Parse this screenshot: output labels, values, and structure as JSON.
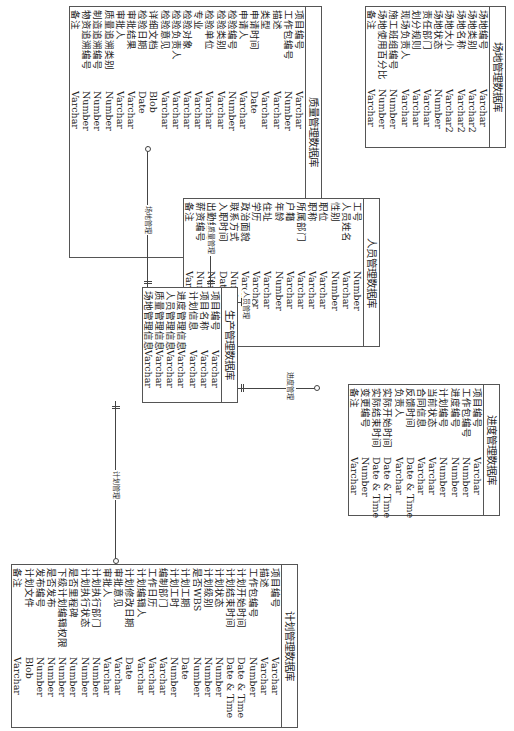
{
  "tables": {
    "site": {
      "title": "场地管理数据库",
      "fields": [
        {
          "name": "场地编号",
          "type": "Varchar"
        },
        {
          "name": "场地类别",
          "type": "Varchar2"
        },
        {
          "name": "场地名称",
          "type": "Varchar2"
        },
        {
          "name": "场地大小",
          "type": "Varchar2"
        },
        {
          "name": "场地状态",
          "type": "Number"
        },
        {
          "name": "责任部门",
          "type": "Varchar"
        },
        {
          "name": "划分规则",
          "type": "Varchar"
        },
        {
          "name": "现场负责人",
          "type": "Varchar"
        },
        {
          "name": "施工班组编号",
          "type": "Number"
        },
        {
          "name": "场地使用百分比",
          "type": "Number"
        },
        {
          "name": "备注",
          "type": "Varchar"
        }
      ]
    },
    "quality": {
      "title": "质量管理数据库",
      "fields": [
        {
          "name": "项目编号",
          "type": "Varchar"
        },
        {
          "name": "工作包编号",
          "type": "Number"
        },
        {
          "name": "描述",
          "type": "Varchar"
        },
        {
          "name": "类型",
          "type": "Varchar"
        },
        {
          "name": "申请时间",
          "type": "Date"
        },
        {
          "name": "申请人",
          "type": "Varchar"
        },
        {
          "name": "检验编号",
          "type": "Number"
        },
        {
          "name": "检验类别",
          "type": "Varchar"
        },
        {
          "name": "检验单位",
          "type": "Varchar"
        },
        {
          "name": "专业",
          "type": "Varchar"
        },
        {
          "name": "检验对象",
          "type": "Varchar"
        },
        {
          "name": "检验负责人",
          "type": "Varchar"
        },
        {
          "name": "检验意见",
          "type": "Varchar"
        },
        {
          "name": "详细文档",
          "type": "Blob"
        },
        {
          "name": "检验日期",
          "type": "Date"
        },
        {
          "name": "审批结果",
          "type": "Varchar"
        },
        {
          "name": "审批人",
          "type": "Varchar"
        },
        {
          "name": "质量追溯类别",
          "type": "Number"
        },
        {
          "name": "制造追溯编号",
          "type": "Number"
        },
        {
          "name": "物资追溯编号",
          "type": "Number"
        },
        {
          "name": "备注",
          "type": "Varchar"
        }
      ]
    },
    "personnel": {
      "title": "人员管理数据库",
      "fields": [
        {
          "name": "工号",
          "type": "Number"
        },
        {
          "name": "人员姓名",
          "type": "Varchar"
        },
        {
          "name": "性别",
          "type": "Number"
        },
        {
          "name": "职位",
          "type": "Varchar"
        },
        {
          "name": "职称",
          "type": "Varchar"
        },
        {
          "name": "所属部门",
          "type": "Varchar"
        },
        {
          "name": "户籍",
          "type": "Varchar"
        },
        {
          "name": "年龄",
          "type": "Number"
        },
        {
          "name": "住址",
          "type": "Varchar"
        },
        {
          "name": "学历",
          "type": "Varchar"
        },
        {
          "name": "政治面貌",
          "type": "Varchar"
        },
        {
          "name": "联系方式",
          "type": "Number"
        },
        {
          "name": "入职时间",
          "type": "Date"
        },
        {
          "name": "出勤编号",
          "type": "Number"
        },
        {
          "name": "薪资编号",
          "type": "Number"
        },
        {
          "name": "备注",
          "type": "Varchar"
        }
      ]
    },
    "production": {
      "title": "生产管理数据库",
      "fields": [
        {
          "name": "项目编号",
          "type": "Varchar"
        },
        {
          "name": "项目名称",
          "type": "Varchar"
        },
        {
          "name": "计划信息",
          "type": "Varchar"
        },
        {
          "name": "进度管理信息",
          "type": "Varchar"
        },
        {
          "name": "人员管理信息",
          "type": "Varchar"
        },
        {
          "name": "质量管理信息",
          "type": "Varchar"
        },
        {
          "name": "场地管理信息",
          "type": "Varchar"
        }
      ]
    },
    "progress": {
      "title": "进度管理数据库",
      "fields": [
        {
          "name": "项目编号",
          "type": "Varchar"
        },
        {
          "name": "工作包编号",
          "type": "Number"
        },
        {
          "name": "进度编号",
          "type": "Number"
        },
        {
          "name": "计划编号",
          "type": "Number"
        },
        {
          "name": "当前状态",
          "type": "Varchar"
        },
        {
          "name": "合同信息",
          "type": "Varchar"
        },
        {
          "name": "反馈时间",
          "type": "Date & Time"
        },
        {
          "name": "负责人",
          "type": "Varchar"
        },
        {
          "name": "实际开始时间",
          "type": "Date & Time"
        },
        {
          "name": "实际结束时间",
          "type": "Date & Time"
        },
        {
          "name": "变更编号",
          "type": "Number"
        },
        {
          "name": "备注",
          "type": "Varchar"
        }
      ]
    },
    "plan": {
      "title": "计划管理数据库",
      "fields": [
        {
          "name": "项目编号",
          "type": "Varchar"
        },
        {
          "name": "描述",
          "type": "Varchar"
        },
        {
          "name": "工作包编号",
          "type": "Number"
        },
        {
          "name": "计划开始时间",
          "type": "Date & Time"
        },
        {
          "name": "计划结束时间",
          "type": "Date & Time"
        },
        {
          "name": "计划状态",
          "type": "Number"
        },
        {
          "name": "计划级别",
          "type": "Number"
        },
        {
          "name": "是否WBS",
          "type": "Number"
        },
        {
          "name": "计划工期",
          "type": "Date"
        },
        {
          "name": "计划工时",
          "type": "Number"
        },
        {
          "name": "编制部门",
          "type": "Varchar"
        },
        {
          "name": "工作日历",
          "type": "Varchar"
        },
        {
          "name": "计划编辑人",
          "type": "Varchar"
        },
        {
          "name": "计划修改日期",
          "type": "Date"
        },
        {
          "name": "审批意见",
          "type": "Varchar"
        },
        {
          "name": "审批人",
          "type": "Varchar"
        },
        {
          "name": "计划执行部门",
          "type": "Number"
        },
        {
          "name": "计划执行状态",
          "type": "Number"
        },
        {
          "name": "是否里程碑",
          "type": "Number"
        },
        {
          "name": "下级计划编辑权限",
          "type": "Number"
        },
        {
          "name": "是否发布",
          "type": "Number"
        },
        {
          "name": "发布编号",
          "type": "Number"
        },
        {
          "name": "计划文件",
          "type": "Blob"
        },
        {
          "name": "备注",
          "type": "Varchar"
        }
      ]
    }
  },
  "relations": {
    "site": "场地管理",
    "quality": "质量管理",
    "personnel": "人员管理",
    "progress": "进度管理",
    "plan": "计划管理"
  },
  "colors": {
    "line": "#444444",
    "border": "#555555",
    "background": "#ffffff"
  }
}
